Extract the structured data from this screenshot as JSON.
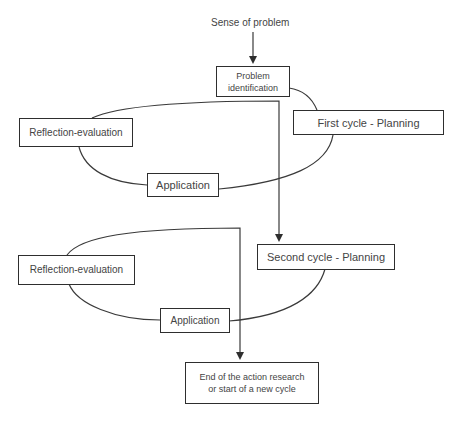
{
  "diagram": {
    "type": "action-research-cycle",
    "start_label": "Sense of problem",
    "nodes": {
      "problem_identification": "Problem identification",
      "first_cycle_planning": "First cycle - Planning",
      "reflection_evaluation_1": "Reflection-evaluation",
      "application_1": "Application",
      "second_cycle_planning": "Second cycle - Planning",
      "reflection_evaluation_2": "Reflection-evaluation",
      "application_2": "Application",
      "end": "End of the action research or start of a new cycle"
    },
    "edges": [
      {
        "from": "Sense of problem",
        "to": "Problem identification",
        "arrow": true
      },
      {
        "from": "Problem identification",
        "to": "First cycle - Planning",
        "arrow": false
      },
      {
        "from": "First cycle - Planning",
        "to": "Application",
        "arrow": false
      },
      {
        "from": "Application",
        "to": "Reflection-evaluation",
        "arrow": false
      },
      {
        "from": "Reflection-evaluation",
        "to": "Second cycle - Planning",
        "arrow": true
      },
      {
        "from": "Second cycle - Planning",
        "to": "Application",
        "arrow": false
      },
      {
        "from": "Application",
        "to": "Reflection-evaluation",
        "arrow": false
      },
      {
        "from": "Reflection-evaluation",
        "to": "End of the action research or start of a new cycle",
        "arrow": true
      }
    ],
    "colors": {
      "line": "#2e2e2e",
      "text": "#444444",
      "background": "#ffffff"
    }
  }
}
